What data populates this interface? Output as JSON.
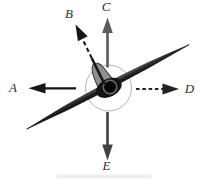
{
  "figure": {
    "bank_angle_deg": 27
  },
  "arrows": {
    "a": {
      "label": "A",
      "direction": "left",
      "line_style": "solid",
      "color": "#161616"
    },
    "b": {
      "label": "B",
      "direction": "up-left",
      "line_style": "dashed",
      "color": "#161616"
    },
    "c": {
      "label": "C",
      "direction": "up",
      "line_style": "solid",
      "color": "#5a5a5a"
    },
    "d": {
      "label": "D",
      "direction": "right",
      "line_style": "dashed",
      "color": "#232323"
    },
    "e": {
      "label": "E",
      "direction": "down",
      "line_style": "solid",
      "color": "#424242"
    }
  },
  "colors": {
    "background": "#ffffff",
    "wing_dark": "#101010",
    "fuselage": "#141414",
    "fin": "#8f8f8f",
    "prop_disc": "#b5b5b5",
    "spinner": "#060606",
    "spinner_ring": "#7d7d7d",
    "label_ink": "#2d2d2d"
  }
}
